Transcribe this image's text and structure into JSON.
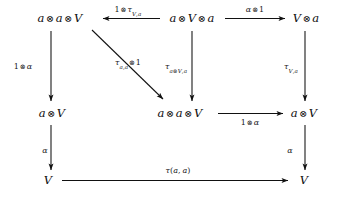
{
  "diagram": {
    "type": "commutative-diagram",
    "background_color": "#ffffff",
    "ink_color": "#0d0d0d",
    "nodes": [
      {
        "id": "n-tl",
        "label": "a ⊗ a ⊗ V",
        "row": "top",
        "col": "left",
        "x": 60,
        "y": 18
      },
      {
        "id": "n-tm",
        "label": "a ⊗ V ⊗ a",
        "row": "top",
        "col": "center",
        "x": 192,
        "y": 18
      },
      {
        "id": "n-tr",
        "label": "V ⊗ a",
        "row": "top",
        "col": "right",
        "x": 305,
        "y": 18
      },
      {
        "id": "n-ml",
        "label": "a ⊗ V",
        "row": "middle",
        "col": "left",
        "x": 52,
        "y": 113
      },
      {
        "id": "n-mm",
        "label": "a ⊗ a ⊗ V",
        "row": "middle",
        "col": "center",
        "x": 178,
        "y": 113
      },
      {
        "id": "n-mr",
        "label": "a ⊗ V",
        "row": "middle",
        "col": "right",
        "x": 303,
        "y": 113
      },
      {
        "id": "n-bl",
        "label": "V",
        "row": "bottom",
        "col": "left",
        "x": 48,
        "y": 180
      },
      {
        "id": "n-br",
        "label": "V",
        "row": "bottom",
        "col": "right",
        "x": 303,
        "y": 180
      }
    ],
    "edges": [
      {
        "id": "e-top-left",
        "from": "n-tm",
        "to": "n-tl",
        "label": "1 ⊗ τ_{V,a}",
        "direction": "left",
        "style": "straight"
      },
      {
        "id": "e-top-right",
        "from": "n-tm",
        "to": "n-tr",
        "label": "α ⊗ 1",
        "direction": "right",
        "style": "straight"
      },
      {
        "id": "e-left-vert",
        "from": "n-tl",
        "to": "n-ml",
        "label": "1 ⊗ α",
        "direction": "down",
        "style": "straight"
      },
      {
        "id": "e-diagonal",
        "from": "n-tl",
        "to": "n-mm",
        "label": "τ_{a,a} ⊗ 1",
        "direction": "down-right",
        "style": "straight"
      },
      {
        "id": "e-mid-vert",
        "from": "n-tm",
        "to": "n-mm",
        "label": "τ_{a⊗V,a}",
        "direction": "down",
        "style": "straight"
      },
      {
        "id": "e-right-vert",
        "from": "n-tr",
        "to": "n-mr",
        "label": "τ_{V,a}",
        "direction": "down",
        "style": "straight"
      },
      {
        "id": "e-mid-horiz",
        "from": "n-mm",
        "to": "n-mr",
        "label": "1 ⊗ α",
        "direction": "right",
        "style": "straight"
      },
      {
        "id": "e-bl-vert",
        "from": "n-ml",
        "to": "n-bl",
        "label": "α",
        "direction": "down",
        "style": "straight"
      },
      {
        "id": "e-br-vert",
        "from": "n-mr",
        "to": "n-br",
        "label": "α",
        "direction": "down",
        "style": "straight"
      },
      {
        "id": "e-bottom",
        "from": "n-bl",
        "to": "n-br",
        "label": "τ(a, a)",
        "direction": "right",
        "style": "straight"
      }
    ],
    "labels": {
      "top_left_node": "a ⊗ a ⊗ V",
      "top_mid_node": "a ⊗ V ⊗ a",
      "top_right_node": "V ⊗ a",
      "mid_left_node": "a ⊗ V",
      "mid_center_node": "a ⊗ a ⊗ V",
      "mid_right_node": "a ⊗ V",
      "bottom_left_node": "V",
      "bottom_right_node": "V",
      "edge_top_left": "1 ⊗ τV,a",
      "edge_top_right": "α ⊗ 1",
      "edge_left_vertical": "1 ⊗ α",
      "edge_diagonal": "τa,a ⊗ 1",
      "edge_mid_vertical": "τa⊗V,a",
      "edge_right_vertical": "τV,a",
      "edge_mid_horizontal": "1 ⊗ α",
      "edge_bottom_left_vertical": "α",
      "edge_bottom_right_vertical": "α",
      "edge_bottom_horizontal": "τ(a, a)"
    },
    "glyphs": {
      "tensor": "⊗",
      "tau": "τ",
      "alpha": "α",
      "one": "1",
      "a": "a",
      "V": "V"
    }
  }
}
